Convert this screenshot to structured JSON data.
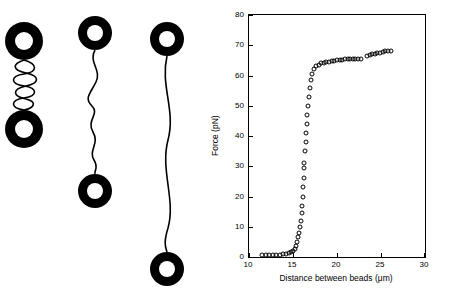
{
  "illustration": {
    "panels": [
      {
        "name": "coiled-dna-schematic",
        "label": ""
      },
      {
        "name": "partially-extended-dna-schematic",
        "label": ""
      },
      {
        "name": "fully-extended-dna-schematic",
        "label": ""
      }
    ],
    "bead_color": "#000000"
  },
  "chart_data": {
    "type": "scatter",
    "title": "",
    "xlabel": "Distance between beads (μm)",
    "ylabel": "Force (pN)",
    "xlim": [
      10,
      30
    ],
    "ylim": [
      0,
      80
    ],
    "xticks": [
      10,
      15,
      20,
      25,
      30
    ],
    "yticks": [
      0,
      10,
      20,
      30,
      40,
      50,
      60,
      70,
      80
    ],
    "grid": false,
    "legend": false,
    "marker": "open-circle",
    "marker_color": "#000000",
    "points": [
      [
        11.5,
        0.6
      ],
      [
        11.9,
        0.5
      ],
      [
        12.3,
        0.7
      ],
      [
        12.7,
        0.6
      ],
      [
        13.1,
        0.8
      ],
      [
        13.5,
        0.7
      ],
      [
        13.9,
        0.9
      ],
      [
        14.2,
        1.0
      ],
      [
        14.5,
        1.2
      ],
      [
        14.8,
        1.6
      ],
      [
        15.0,
        2.0
      ],
      [
        15.2,
        2.8
      ],
      [
        15.35,
        3.6
      ],
      [
        15.5,
        5.0
      ],
      [
        15.6,
        6.5
      ],
      [
        15.7,
        8.0
      ],
      [
        15.8,
        10.0
      ],
      [
        15.9,
        12.0
      ],
      [
        16.0,
        14.5
      ],
      [
        16.05,
        17.0
      ],
      [
        16.1,
        20.0
      ],
      [
        16.15,
        23.0
      ],
      [
        16.2,
        26.0
      ],
      [
        16.3,
        29.5
      ],
      [
        16.3,
        31.0
      ],
      [
        16.4,
        35.0
      ],
      [
        16.45,
        38.0
      ],
      [
        16.5,
        41.0
      ],
      [
        16.55,
        44.0
      ],
      [
        16.6,
        47.0
      ],
      [
        16.7,
        50.0
      ],
      [
        16.8,
        53.0
      ],
      [
        16.9,
        56.0
      ],
      [
        17.0,
        58.5
      ],
      [
        17.2,
        60.5
      ],
      [
        17.4,
        62.0
      ],
      [
        17.6,
        63.0
      ],
      [
        17.9,
        63.5
      ],
      [
        18.2,
        64.0
      ],
      [
        18.5,
        64.2
      ],
      [
        18.8,
        64.5
      ],
      [
        19.1,
        64.6
      ],
      [
        19.4,
        64.7
      ],
      [
        19.7,
        64.8
      ],
      [
        20.0,
        65.0
      ],
      [
        20.3,
        65.1
      ],
      [
        20.6,
        65.2
      ],
      [
        20.9,
        65.3
      ],
      [
        21.2,
        65.4
      ],
      [
        21.5,
        65.5
      ],
      [
        21.8,
        65.6
      ],
      [
        22.1,
        65.6
      ],
      [
        22.4,
        65.5
      ],
      [
        22.7,
        65.4
      ],
      [
        23.4,
        66.5
      ],
      [
        23.7,
        66.8
      ],
      [
        24.0,
        67.0
      ],
      [
        24.3,
        67.2
      ],
      [
        24.6,
        67.4
      ],
      [
        24.9,
        67.6
      ],
      [
        25.2,
        67.8
      ],
      [
        25.5,
        68.0
      ],
      [
        25.8,
        68.1
      ],
      [
        26.1,
        68.2
      ]
    ]
  }
}
